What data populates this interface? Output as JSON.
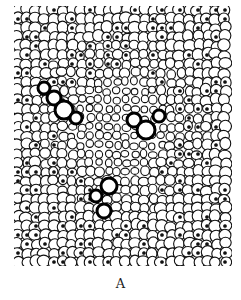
{
  "figure": {
    "caption": "A",
    "colors": {
      "ink": "#111111",
      "paper": "#ffffff"
    }
  }
}
